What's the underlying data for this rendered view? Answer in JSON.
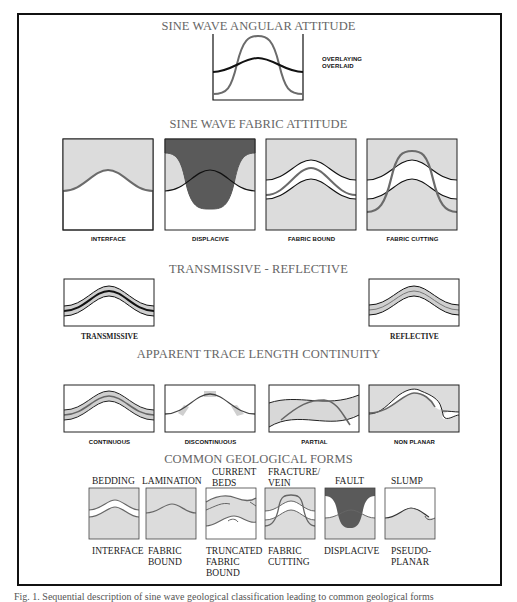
{
  "figure": {
    "caption": "Fig. 1. Sequential description of sine wave geological classification leading to common geological forms",
    "colors": {
      "stipple_fill": "#dcdcdc",
      "dark_fill": "#5a5a5a",
      "gray_line": "#6b6b6b",
      "black_line": "#111111",
      "title_text": "#666666"
    }
  },
  "sections": {
    "angular": {
      "title": "SINE WAVE  ANGULAR ATTITUDE",
      "legend": [
        "OVERLAYING",
        "OVERLAID"
      ]
    },
    "fabric": {
      "title": "SINE WAVE FABRIC ATTITUDE",
      "panels": [
        "INTERFACE",
        "DISPLACIVE",
        "FABRIC BOUND",
        "FABRIC CUTTING"
      ]
    },
    "transmissive": {
      "title": "TRANSMISSIVE - REFLECTIVE",
      "panels": [
        "TRANSMISSIVE",
        "REFLECTIVE"
      ]
    },
    "continuity": {
      "title": "APPARENT TRACE LENGTH CONTINUITY",
      "panels": [
        "CONTINUOUS",
        "DISCONTINUOUS",
        "PARTIAL",
        "NON PLANAR"
      ]
    },
    "geological": {
      "title": "COMMON GEOLOGICAL FORMS",
      "forms": [
        {
          "top": [
            "BEDDING"
          ],
          "bottom": [
            "INTERFACE"
          ]
        },
        {
          "top": [
            "LAMINATION"
          ],
          "bottom": [
            "FABRIC",
            "BOUND"
          ]
        },
        {
          "top": [
            "CURRENT",
            "BEDS"
          ],
          "bottom": [
            "TRUNCATED",
            "FABRIC",
            "BOUND"
          ]
        },
        {
          "top": [
            "FRACTURE/",
            "VEIN"
          ],
          "bottom": [
            "FABRIC",
            "CUTTING"
          ]
        },
        {
          "top": [
            "FAULT"
          ],
          "bottom": [
            "DISPLACIVE"
          ]
        },
        {
          "top": [
            "SLUMP"
          ],
          "bottom": [
            "PSEUDO-",
            "PLANAR"
          ]
        }
      ]
    }
  }
}
